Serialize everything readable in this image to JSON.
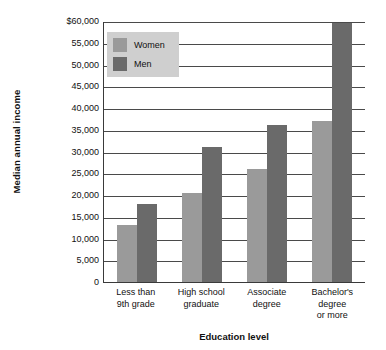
{
  "chart_data": {
    "type": "bar",
    "title": "",
    "xlabel": "Education level",
    "ylabel": "Median annual income",
    "categories": [
      "Less than 9th grade",
      "High school graduate",
      "Associate degree",
      "Bachelor's degree or more"
    ],
    "category_lines": [
      [
        "Less than",
        "9th grade"
      ],
      [
        "High school",
        "graduate"
      ],
      [
        "Associate",
        "degree"
      ],
      [
        "Bachelor's",
        "degree",
        "or more"
      ]
    ],
    "series": [
      {
        "name": "Women",
        "color": "#9a9a9a",
        "values": [
          13000,
          20500,
          26000,
          37000
        ]
      },
      {
        "name": "Men",
        "color": "#6a6a6a",
        "values": [
          18000,
          31000,
          36000,
          59500
        ]
      }
    ],
    "ylim": [
      0,
      60000
    ],
    "ytick_values": [
      60000,
      55000,
      50000,
      45000,
      40000,
      35000,
      30000,
      25000,
      20000,
      15000,
      10000,
      5000,
      0
    ],
    "ytick_labels": [
      "$60,000",
      "55,000",
      "50,000",
      "45,000",
      "40,000",
      "35,000",
      "30,000",
      "25,000",
      "20,000",
      "15,000",
      "10,000",
      "5,000",
      "0"
    ],
    "grid": "horizontal",
    "legend_position": "top-left-inside"
  },
  "legend": {
    "items": [
      {
        "label": "Women"
      },
      {
        "label": "Men"
      }
    ]
  },
  "axes": {
    "y_title": "Median annual income",
    "x_title": "Education level"
  }
}
